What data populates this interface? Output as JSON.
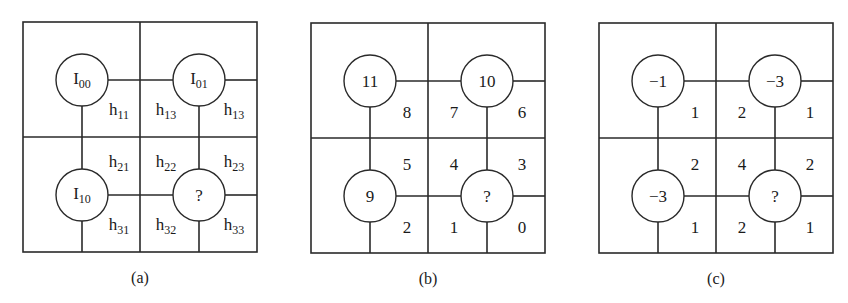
{
  "figure": {
    "geometry": {
      "box": {
        "x": 0,
        "y": 0,
        "w": 234,
        "h": 230
      },
      "mid": {
        "x": 117,
        "y": 115
      },
      "nodes": [
        {
          "cx": 59,
          "cy": 58
        },
        {
          "cx": 176,
          "cy": 58
        },
        {
          "cx": 59,
          "cy": 173
        },
        {
          "cx": 176,
          "cy": 173
        }
      ],
      "radius": 26,
      "cells": [
        {
          "x": 96,
          "y": 89
        },
        {
          "x": 143,
          "y": 89
        },
        {
          "x": 211,
          "y": 89
        },
        {
          "x": 96,
          "y": 141
        },
        {
          "x": 143,
          "y": 141
        },
        {
          "x": 211,
          "y": 141
        },
        {
          "x": 96,
          "y": 204
        },
        {
          "x": 143,
          "y": 204
        },
        {
          "x": 211,
          "y": 204
        }
      ]
    },
    "panels": [
      {
        "id": "a",
        "caption": "(a)",
        "origin": {
          "x": 23,
          "y": 22
        },
        "nodes": [
          {
            "base": "I",
            "sub": "00"
          },
          {
            "base": "I",
            "sub": "01"
          },
          {
            "base": "I",
            "sub": "10"
          },
          {
            "base": "?",
            "sub": ""
          }
        ],
        "cells": [
          {
            "base": "h",
            "sub": "11"
          },
          {
            "base": "h",
            "sub": "13"
          },
          {
            "base": "h",
            "sub": "13"
          },
          {
            "base": "h",
            "sub": "21"
          },
          {
            "base": "h",
            "sub": "22"
          },
          {
            "base": "h",
            "sub": "23"
          },
          {
            "base": "h",
            "sub": "31"
          },
          {
            "base": "h",
            "sub": "32"
          },
          {
            "base": "h",
            "sub": "33"
          }
        ]
      },
      {
        "id": "b",
        "caption": "(b)",
        "origin": {
          "x": 311,
          "y": 23
        },
        "nodes": [
          {
            "base": "11",
            "sub": ""
          },
          {
            "base": "10",
            "sub": ""
          },
          {
            "base": "9",
            "sub": ""
          },
          {
            "base": "?",
            "sub": ""
          }
        ],
        "cells": [
          {
            "base": "8",
            "sub": ""
          },
          {
            "base": "7",
            "sub": ""
          },
          {
            "base": "6",
            "sub": ""
          },
          {
            "base": "5",
            "sub": ""
          },
          {
            "base": "4",
            "sub": ""
          },
          {
            "base": "3",
            "sub": ""
          },
          {
            "base": "2",
            "sub": ""
          },
          {
            "base": "1",
            "sub": ""
          },
          {
            "base": "0",
            "sub": ""
          }
        ]
      },
      {
        "id": "c",
        "caption": "(c)",
        "origin": {
          "x": 599,
          "y": 23
        },
        "nodes": [
          {
            "base": "−1",
            "sub": ""
          },
          {
            "base": "−3",
            "sub": ""
          },
          {
            "base": "−3",
            "sub": ""
          },
          {
            "base": "?",
            "sub": ""
          }
        ],
        "cells": [
          {
            "base": "1",
            "sub": ""
          },
          {
            "base": "2",
            "sub": ""
          },
          {
            "base": "1",
            "sub": ""
          },
          {
            "base": "2",
            "sub": ""
          },
          {
            "base": "4",
            "sub": ""
          },
          {
            "base": "2",
            "sub": ""
          },
          {
            "base": "1",
            "sub": ""
          },
          {
            "base": "2",
            "sub": ""
          },
          {
            "base": "1",
            "sub": ""
          }
        ]
      }
    ]
  }
}
